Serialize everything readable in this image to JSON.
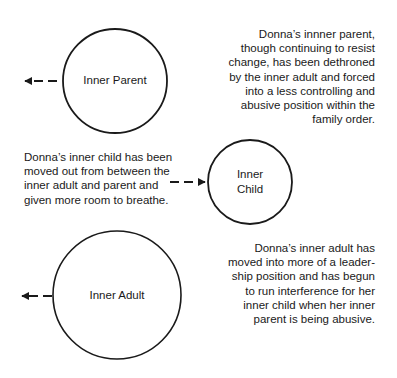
{
  "diagram": {
    "nodes": [
      {
        "id": "parent",
        "label": "Inner Parent",
        "cx": 115,
        "cy": 81,
        "r": 52
      },
      {
        "id": "child",
        "label_lines": [
          "Inner",
          "Child"
        ],
        "cx": 250,
        "cy": 182,
        "r": 42
      },
      {
        "id": "adult",
        "label": "Inner Adult",
        "cx": 117,
        "cy": 295,
        "r": 64
      }
    ],
    "arrows": [
      {
        "from_node": "parent",
        "direction": "left",
        "style": "dashed"
      },
      {
        "to_node": "child",
        "direction": "right",
        "style": "dashed"
      },
      {
        "from_node": "adult",
        "direction": "left",
        "style": "dashed"
      }
    ],
    "notes": {
      "parent": [
        "Donna’s innner parent,",
        "though continuing to resist",
        "change, has been dethroned",
        "by the inner adult and forced",
        "into a less controlling and",
        "abusive position within the",
        "family order."
      ],
      "child": [
        "Donna’s inner child has been",
        "moved out from between the",
        "inner adult and parent and",
        "given more room to breathe."
      ],
      "adult": [
        "Donna’s inner adult has",
        "moved into more of a leader-",
        "ship position and has begun",
        "to run interference for her",
        "inner child when her inner",
        "parent is being abusive."
      ]
    },
    "stroke_color": "#1a1a1a"
  }
}
